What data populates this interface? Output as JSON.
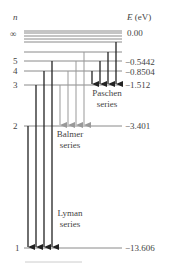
{
  "diagram": {
    "axis_left_label": "n",
    "axis_right_label_var": "E",
    "axis_right_label_unit": "(eV)",
    "levels": [
      {
        "n": "∞",
        "energy": "0.00"
      },
      {
        "n": "5",
        "energy": "−0.5442"
      },
      {
        "n": "4",
        "energy": "−0.8504"
      },
      {
        "n": "3",
        "energy": "−1.512"
      },
      {
        "n": "2",
        "energy": "−3.401"
      },
      {
        "n": "1",
        "energy": "−13.606"
      }
    ],
    "series": [
      {
        "name_line1": "Lyman",
        "name_line2": "series"
      },
      {
        "name_line1": "Balmer",
        "name_line2": "series"
      },
      {
        "name_line1": "Paschen",
        "name_line2": "series"
      }
    ],
    "colors": {
      "level_line": "#888888",
      "lyman_arrow": "#222222",
      "balmer_arrow": "#999999",
      "paschen_arrow": "#222222"
    }
  }
}
